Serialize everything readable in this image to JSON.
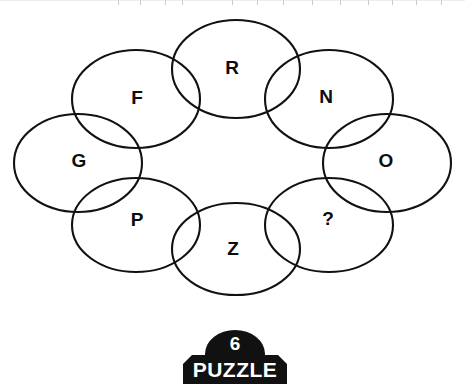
{
  "puzzle": {
    "type": "overlapping-ellipse-letter-ring",
    "background_color": "#ffffff",
    "stroke_color": "#111111",
    "label_color": "#0d0d0d",
    "cells": [
      {
        "id": "top-center",
        "label": "R",
        "cx": 236,
        "cy": 69,
        "rx": 64,
        "ry": 49,
        "label_x": 232,
        "label_y": 69
      },
      {
        "id": "upper-left",
        "label": "F",
        "cx": 136,
        "cy": 99,
        "rx": 64,
        "ry": 49,
        "label_x": 137,
        "label_y": 99
      },
      {
        "id": "upper-right",
        "label": "N",
        "cx": 329,
        "cy": 99,
        "rx": 64,
        "ry": 49,
        "label_x": 326,
        "label_y": 98
      },
      {
        "id": "far-left",
        "label": "G",
        "cx": 78,
        "cy": 163,
        "rx": 64,
        "ry": 49,
        "label_x": 79,
        "label_y": 162
      },
      {
        "id": "far-right",
        "label": "O",
        "cx": 387,
        "cy": 163,
        "rx": 64,
        "ry": 49,
        "label_x": 386,
        "label_y": 162
      },
      {
        "id": "lower-left",
        "label": "P",
        "cx": 136,
        "cy": 225,
        "rx": 64,
        "ry": 47,
        "label_x": 137,
        "label_y": 221
      },
      {
        "id": "bottom-center",
        "label": "Z",
        "cx": 236,
        "cy": 249,
        "rx": 64,
        "ry": 46,
        "label_x": 233,
        "label_y": 250
      },
      {
        "id": "lower-right",
        "label": "?",
        "cx": 329,
        "cy": 225,
        "rx": 64,
        "ry": 47,
        "label_x": 328,
        "label_y": 220
      }
    ],
    "missing_cell": "lower-right",
    "missing_marker": "?"
  },
  "badge": {
    "number": "6",
    "word": "PUZZLE",
    "fill_color": "#111111",
    "text_color": "#ffffff"
  },
  "ruler": {
    "visible": true,
    "tick_color": "#c9c9d2",
    "tick_positions": [
      118,
      140,
      165,
      182,
      232,
      257,
      283,
      312,
      340,
      368,
      392,
      416,
      441
    ]
  }
}
